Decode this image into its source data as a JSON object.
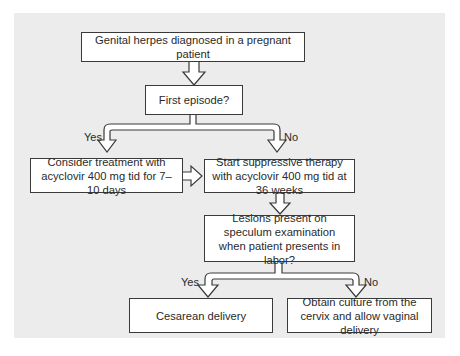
{
  "flowchart": {
    "nodes": {
      "start": "Genital herpes diagnosed in a pregnant patient",
      "first_episode": "First episode?",
      "consider_treatment": "Consider treatment with acyclovir 400 mg tid for 7–10 days",
      "suppressive_therapy": "Start suppressive therapy with acyclovir 400 mg tid at 36 weeks",
      "lesions_question": "Lesions present on speculum examination when patient presents in labor?",
      "cesarean": "Cesarean delivery",
      "culture_vaginal": "Obtain culture from the cervix and allow vaginal delivery"
    },
    "branch_labels": {
      "first_yes": "Yes",
      "first_no": "No",
      "lesions_yes": "Yes",
      "lesions_no": "No"
    },
    "colors": {
      "panel": "#ececec",
      "box_fill": "#ffffff",
      "stroke": "#3a3a3a"
    }
  }
}
